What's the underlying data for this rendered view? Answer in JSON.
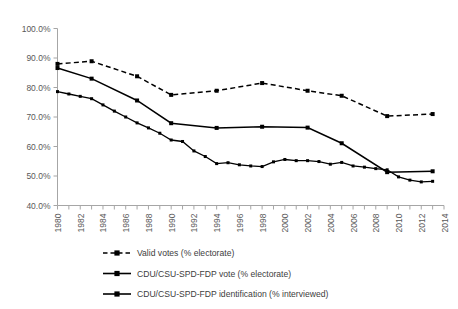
{
  "chart_data": {
    "type": "line",
    "title": "",
    "xlabel": "",
    "ylabel": "",
    "xlim": [
      1980,
      2014
    ],
    "ylim": [
      0.4,
      1.0
    ],
    "grid": false,
    "legend_position": "bottom",
    "y_ticks": [
      "40.0%",
      "50.0%",
      "60.0%",
      "70.0%",
      "80.0%",
      "90.0%",
      "100.0%"
    ],
    "y_tick_values": [
      0.4,
      0.5,
      0.6,
      0.7,
      0.8,
      0.9,
      1.0
    ],
    "x_ticks": [
      "1980",
      "1982",
      "1984",
      "1986",
      "1988",
      "1990",
      "1992",
      "1994",
      "1996",
      "1998",
      "2000",
      "2002",
      "2004",
      "2006",
      "2008",
      "2010",
      "2012",
      "2014"
    ],
    "x_tick_values": [
      1980,
      1982,
      1984,
      1986,
      1988,
      1990,
      1992,
      1994,
      1996,
      1998,
      2000,
      2002,
      2004,
      2006,
      2008,
      2010,
      2012,
      2014
    ],
    "x_minor_ticks": [
      1980,
      1981,
      1982,
      1983,
      1984,
      1985,
      1986,
      1987,
      1988,
      1989,
      1990,
      1991,
      1992,
      1993,
      1994,
      1995,
      1996,
      1997,
      1998,
      1999,
      2000,
      2001,
      2002,
      2003,
      2004,
      2005,
      2006,
      2007,
      2008,
      2009,
      2010,
      2011,
      2012,
      2013,
      2014
    ],
    "series": [
      {
        "name": "Valid votes (% electorate)",
        "style": "dashed",
        "color": "#000000",
        "marker": "square",
        "x": [
          1980,
          1983,
          1987,
          1990,
          1994,
          1998,
          2002,
          2005,
          2009,
          2013
        ],
        "values": [
          0.88,
          0.889,
          0.838,
          0.775,
          0.789,
          0.815,
          0.789,
          0.772,
          0.703,
          0.71
        ]
      },
      {
        "name": "CDU/CSU-SPD-FDP vote (% electorate)",
        "style": "solid",
        "color": "#000000",
        "marker": "square",
        "x": [
          1980,
          1983,
          1987,
          1990,
          1994,
          1998,
          2002,
          2005,
          2009,
          2013
        ],
        "values": [
          0.866,
          0.83,
          0.756,
          0.679,
          0.663,
          0.667,
          0.664,
          0.611,
          0.513,
          0.516
        ]
      },
      {
        "name": "CDU/CSU-SPD-FDP identification (% interviewed)",
        "style": "solid",
        "color": "#000000",
        "marker": "square",
        "x": [
          1980,
          1981,
          1982,
          1983,
          1984,
          1985,
          1986,
          1987,
          1988,
          1989,
          1990,
          1991,
          1992,
          1993,
          1994,
          1995,
          1996,
          1997,
          1998,
          1999,
          2000,
          2001,
          2002,
          2003,
          2004,
          2005,
          2006,
          2007,
          2008,
          2009,
          2010,
          2011,
          2012,
          2013
        ],
        "values": [
          0.786,
          0.778,
          0.77,
          0.762,
          0.741,
          0.72,
          0.7,
          0.68,
          0.663,
          0.645,
          0.622,
          0.617,
          0.585,
          0.566,
          0.542,
          0.545,
          0.538,
          0.534,
          0.532,
          0.548,
          0.556,
          0.552,
          0.552,
          0.549,
          0.54,
          0.546,
          0.534,
          0.53,
          0.525,
          0.521,
          0.497,
          0.486,
          0.48,
          0.482
        ]
      }
    ]
  },
  "legend": {
    "items": [
      {
        "label": "Valid votes (% electorate)",
        "style": "dashed"
      },
      {
        "label": "CDU/CSU-SPD-FDP vote (% electorate)",
        "style": "solid"
      },
      {
        "label": "CDU/CSU-SPD-FDP identification (% interviewed)",
        "style": "solid"
      }
    ]
  }
}
